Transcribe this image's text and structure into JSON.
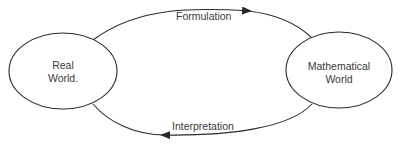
{
  "diagram": {
    "type": "cycle",
    "colors": {
      "stroke": "#2a2a2a",
      "text": "#3a3a3a",
      "background": "#ffffff"
    },
    "nodes": [
      {
        "id": "real",
        "line1": "Real",
        "line2": "World."
      },
      {
        "id": "math",
        "line1": "Mathematical",
        "line2": "World"
      }
    ],
    "edges": [
      {
        "from": "real",
        "to": "math",
        "label": "Formulation"
      },
      {
        "from": "math",
        "to": "real",
        "label": "Interpretation"
      }
    ]
  }
}
